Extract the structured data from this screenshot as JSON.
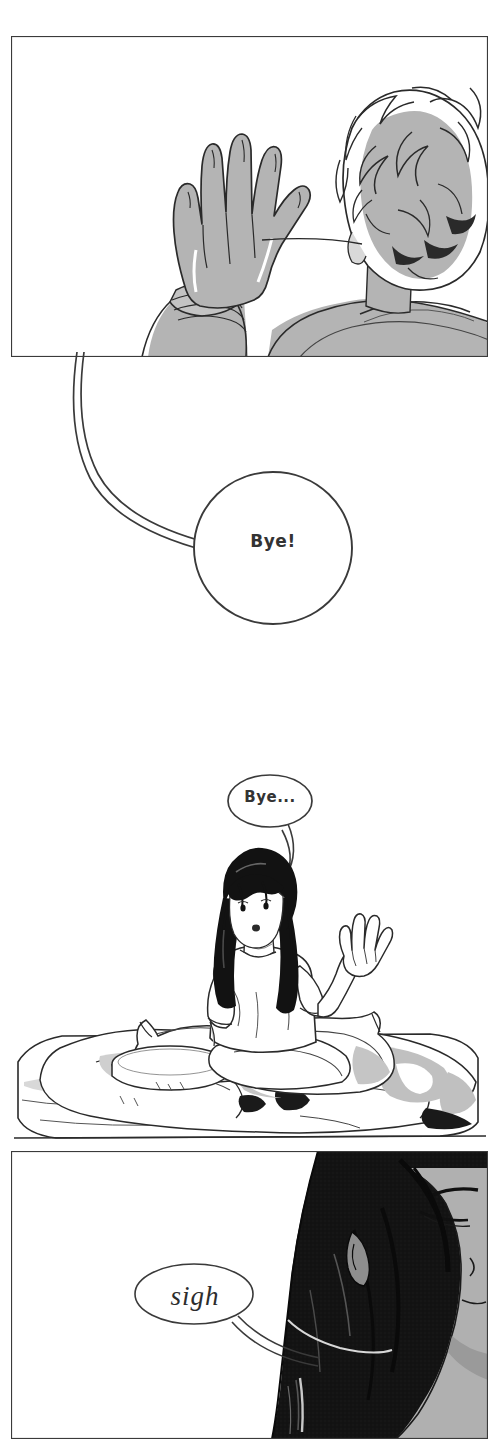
{
  "page": {
    "kind": "webtoon-comic-page",
    "width": 499,
    "height": 1439,
    "background_color": "#ffffff",
    "ink_color": "#222222",
    "tone_gray": "#b0b0b0",
    "tone_gray_light": "#d3d3d3",
    "tone_black": "#121212"
  },
  "panels": [
    {
      "id": "panel-1",
      "label": "Panel 1 — boy from behind waving goodbye",
      "has_border": true,
      "x": 10,
      "y": 35,
      "width": 479,
      "height": 323,
      "description": "Back view of a light-haired boy raising his hand to wave"
    },
    {
      "id": "panel-2",
      "label": "Panel 2 — girl sitting on bed waving back",
      "has_border": false,
      "x": 0,
      "y": 770,
      "width": 499,
      "height": 380,
      "description": "Borderless full-bleed scene of a long dark-haired girl sitting cross-legged on a rumpled bed with cat-eared pillows"
    },
    {
      "id": "panel-3",
      "label": "Panel 3 — close-up of girl's face sighing",
      "has_border": true,
      "x": 10,
      "y": 1150,
      "width": 479,
      "height": 289,
      "description": "Close-up profile of the girl with heavy black hair filling the right of the panel"
    }
  ],
  "balloons": [
    {
      "id": "balloon-bye-exclaim",
      "text": "Bye!",
      "shape": "circle",
      "tail": "long-curved-tail-up-left",
      "cx": 273,
      "cy": 548,
      "rx": 79,
      "ry": 76,
      "panel": "panel-1",
      "speaker": "boy"
    },
    {
      "id": "balloon-bye-ellipsis",
      "text": "Bye...",
      "shape": "ellipse",
      "tail": "short-curved-tail-down-left",
      "cx": 270,
      "cy": 801,
      "rx": 42,
      "ry": 26,
      "panel": "panel-2",
      "speaker": "girl"
    },
    {
      "id": "balloon-sigh",
      "text": "sigh",
      "shape": "ellipse",
      "tail": "long-curved-tail-right",
      "cx": 194,
      "cy": 1294,
      "rx": 59,
      "ry": 30,
      "panel": "panel-3",
      "speaker": "girl"
    }
  ],
  "figures": [
    {
      "id": "figure-boy",
      "label": "boy-back-view",
      "panel": "panel-1",
      "hair": "light wavy",
      "pose": "raised waving hand"
    },
    {
      "id": "figure-girl",
      "label": "girl-sitting",
      "panel": "panel-2",
      "hair": "long black straight",
      "pose": "sitting cross-legged, waving"
    },
    {
      "id": "figure-girl-closeup",
      "label": "girl-closeup-profile",
      "panel": "panel-3",
      "hair": "long black straight",
      "pose": "profile, eyes lowered"
    }
  ],
  "props": [
    {
      "id": "prop-bed",
      "label": "bed"
    },
    {
      "id": "prop-pillow-cat-left",
      "label": "cat-eared pillow left"
    },
    {
      "id": "prop-pillow-cat-right",
      "label": "cat-eared pillow right"
    },
    {
      "id": "prop-round-cushion",
      "label": "round cushion"
    },
    {
      "id": "prop-blanket",
      "label": "rumpled blanket"
    }
  ]
}
